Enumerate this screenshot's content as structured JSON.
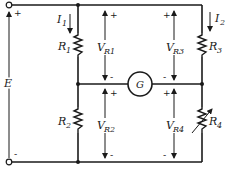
{
  "diagram": {
    "type": "wheatstone-bridge-circuit",
    "source": {
      "label": "E",
      "top_polarity": "+",
      "bottom_polarity": "-"
    },
    "currents": [
      {
        "label": "I",
        "subscript": "1",
        "branch": "left"
      },
      {
        "label": "I",
        "subscript": "2",
        "branch": "right"
      }
    ],
    "resistors": [
      {
        "label": "R",
        "subscript": "1",
        "position": "top-left",
        "variable": false
      },
      {
        "label": "R",
        "subscript": "2",
        "position": "bottom-left",
        "variable": false
      },
      {
        "label": "R",
        "subscript": "3",
        "position": "top-right",
        "variable": false
      },
      {
        "label": "R",
        "subscript": "4",
        "position": "bottom-right",
        "variable": true
      }
    ],
    "voltages": [
      {
        "label": "V",
        "subscript": "R1",
        "plus": "+",
        "minus": "-"
      },
      {
        "label": "V",
        "subscript": "R2",
        "plus": "+",
        "minus": "-"
      },
      {
        "label": "V",
        "subscript": "R3",
        "plus": "+",
        "minus": "-"
      },
      {
        "label": "V",
        "subscript": "R4",
        "plus": "+",
        "minus": "-"
      }
    ],
    "galvanometer": {
      "label": "G",
      "left_polarity_top": "-",
      "left_polarity_bottom": "+",
      "right_polarity_top": "-",
      "right_polarity_bottom": "+"
    }
  }
}
